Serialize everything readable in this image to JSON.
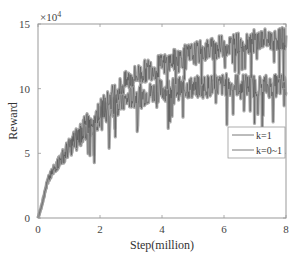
{
  "chart_data": {
    "type": "line",
    "title": "",
    "xlabel": "Step(million)",
    "ylabel": "Reward",
    "y_multiplier": "×10^4",
    "xlim": [
      0,
      8
    ],
    "ylim": [
      0,
      15
    ],
    "xticks": [
      0,
      2,
      4,
      6,
      8
    ],
    "yticks": [
      0,
      5,
      10,
      15
    ],
    "grid": false,
    "legend_position": "right-middle",
    "x": [
      0,
      0.1,
      0.2,
      0.3,
      0.5,
      0.75,
      1.0,
      1.25,
      1.5,
      1.75,
      2.0,
      2.25,
      2.5,
      2.75,
      3.0,
      3.5,
      4.0,
      4.5,
      5.0,
      5.5,
      6.0,
      6.5,
      7.0,
      7.5,
      8.0
    ],
    "series": [
      {
        "name": "k=1",
        "values": [
          0,
          0.8,
          1.8,
          2.8,
          3.7,
          4.6,
          5.4,
          6.1,
          6.8,
          7.3,
          7.8,
          8.3,
          8.7,
          9.0,
          9.3,
          9.6,
          9.9,
          10.0,
          10.1,
          10.2,
          10.3,
          10.3,
          10.2,
          10.2,
          10.3
        ]
      },
      {
        "name": "k=0~1",
        "values": [
          0,
          0.8,
          1.8,
          2.8,
          3.7,
          4.6,
          5.4,
          6.2,
          7.0,
          7.6,
          8.3,
          9.0,
          9.7,
          10.3,
          10.8,
          11.4,
          11.8,
          12.3,
          12.7,
          13.0,
          13.3,
          13.5,
          13.7,
          13.8,
          13.9
        ]
      }
    ]
  },
  "legend": {
    "items": [
      {
        "label": "k=1"
      },
      {
        "label": "k=0~1"
      }
    ]
  },
  "axes": {
    "xlabel": "Step(million)",
    "ylabel": "Reward",
    "multiplier_base": "×10",
    "multiplier_exp": "4",
    "xtick_labels": [
      "0",
      "2",
      "4",
      "6",
      "8"
    ],
    "ytick_labels": [
      "0",
      "5",
      "10",
      "15"
    ]
  },
  "colors": {
    "band": "#9a9a9a",
    "line": "#4a4a4a",
    "axis": "#999999",
    "legend_line": "#555555"
  }
}
